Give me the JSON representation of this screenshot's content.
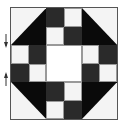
{
  "figure": {
    "type": "quilt-block",
    "grid": 6,
    "colors": {
      "dark": "#2a2a2a",
      "black": "#0a0a0a",
      "light": "#f4f4f4",
      "background": "#ffffff"
    },
    "rows": [
      [
        "corner-tl",
        "corner-tl",
        "dark",
        "light",
        "corner-tr",
        "corner-tr"
      ],
      [
        "corner-tl",
        "corner-tl",
        "light",
        "dark",
        "corner-tr",
        "corner-tr"
      ],
      [
        "light",
        "dark",
        "center",
        "center",
        "light",
        "dark"
      ],
      [
        "dark",
        "light",
        "center",
        "center",
        "dark",
        "light"
      ],
      [
        "corner-bl",
        "corner-bl",
        "dark",
        "light",
        "corner-br",
        "corner-br"
      ],
      [
        "corner-bl",
        "corner-bl",
        "light",
        "dark",
        "corner-br",
        "corner-br"
      ]
    ],
    "markers": [
      {
        "direction": "down",
        "y": 40
      },
      {
        "direction": "up",
        "y": 78
      }
    ]
  }
}
